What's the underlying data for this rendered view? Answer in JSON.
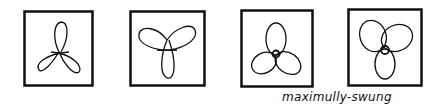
{
  "figure": {
    "panels": [
      {
        "id": "panel-1",
        "description": "trefoil with one lobe up, two lobes down",
        "x": 23,
        "y": 10,
        "w": 70,
        "h": 76
      },
      {
        "id": "panel-2",
        "description": "trefoil with two lobes up, one lobe down",
        "x": 129,
        "y": 10,
        "w": 76,
        "h": 76
      },
      {
        "id": "panel-3",
        "description": "overlapping trefoil, one lobe up",
        "x": 240,
        "y": 9,
        "w": 73,
        "h": 78
      },
      {
        "id": "panel-4",
        "description": "overlapping trefoil, two lobes up",
        "x": 347,
        "y": 8,
        "w": 75,
        "h": 78
      }
    ],
    "caption": "maximully-swung",
    "stroke_color": "#111111",
    "background": "#ffffff"
  }
}
